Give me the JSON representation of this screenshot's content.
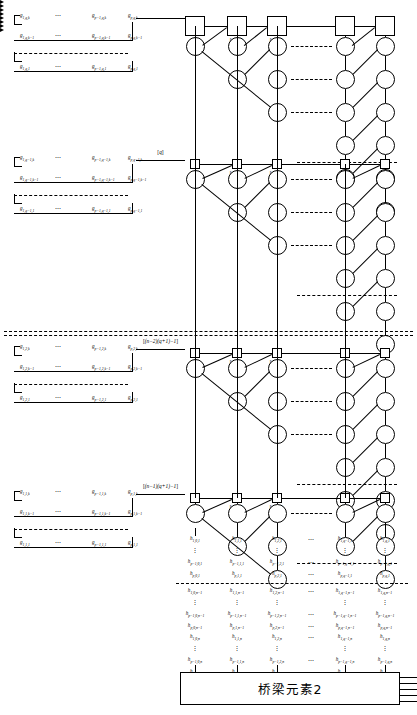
{
  "diagram": {
    "bottom_box": {
      "label": "桥梁元素2"
    },
    "column_tags": [
      "[q]",
      "[q-1]",
      "[q-2]",
      "[1]"
    ],
    "block_tags": [
      "[q]",
      "[(n-2)(q+1)-1]",
      "[(n-1)(q+1)-1]"
    ],
    "ellipsis": "⋯",
    "vertical_ellipsis": "⋮",
    "blocks": [
      {
        "id": "block-1",
        "tag": "",
        "rows": [
          {
            "cells": [
              "g_{1,q,k}",
              "⋯",
              "g_{p-1,q,k}",
              "g_{p,q,k}"
            ]
          },
          {
            "cells": [
              "g_{1,q,k-1}",
              "⋯",
              "g_{p-1,q,k-1}",
              "g_{p,q,k-1}"
            ]
          },
          {
            "cells": [
              "g_{1,q,1}",
              "⋯",
              "g_{p-1,q,1}",
              "g_{p,q,1}"
            ]
          }
        ]
      },
      {
        "id": "block-2",
        "tag": "[q]",
        "rows": [
          {
            "cells": [
              "g_{1,q-1,k}",
              "⋯",
              "g_{p-1,q-1,k}",
              "g_{p,q-1,k}"
            ]
          },
          {
            "cells": [
              "g_{1,q-1,k-1}",
              "⋯",
              "g_{p-1,q-1,k-1}",
              "g_{p,q-1,k-1}"
            ]
          },
          {
            "cells": [
              "g_{1,q-1,1}",
              "⋯",
              "g_{p-1,q-1,1}",
              "g_{p,q-1,1}"
            ]
          }
        ]
      },
      {
        "id": "block-3",
        "tag": "[(n-2)(q+1)-1]",
        "rows": [
          {
            "cells": [
              "g_{1,2,k}",
              "⋯",
              "g_{p-1,2,k}",
              "g_{p,2,k}"
            ]
          },
          {
            "cells": [
              "g_{1,2,k-1}",
              "⋯",
              "g_{p-1,2,k-1}",
              "g_{p,2,k-1}"
            ]
          },
          {
            "cells": [
              "g_{1,2,1}",
              "⋯",
              "g_{p-1,2,1}",
              "g_{p,2,1}"
            ]
          }
        ]
      },
      {
        "id": "block-4",
        "tag": "[(n-1)(q+1)-1]",
        "rows": [
          {
            "cells": [
              "g_{1,1,k}",
              "⋯",
              "g_{p-1,1,k}",
              "g_{p,1,k}"
            ]
          },
          {
            "cells": [
              "g_{1,1,k-1}",
              "⋯",
              "g_{p-1,1,k-1}",
              "g_{p,1,k-1}"
            ]
          },
          {
            "cells": [
              "g_{1,1,1}",
              "⋯",
              "g_{p-1,1,1}",
              "g_{p,1,1}"
            ]
          }
        ]
      }
    ],
    "output_matrix": {
      "columns": [
        "h_{*,0,*}",
        "h_{*,1,*}",
        "h_{*,2,*}",
        "⋯",
        "h_{*,q-1,*}",
        "h_{*,q,*}"
      ],
      "groups": [
        {
          "rows": [
            [
              "h_{1,0,1}",
              "h_{1,1,1}",
              "h_{1,2,1}",
              "⋯",
              "h_{1,q-1,1}",
              "h_{1,q,1}"
            ],
            [
              "⋮",
              "⋮",
              "⋮",
              "",
              "⋮",
              "⋮"
            ],
            [
              "h_{p-1,0,1}",
              "h_{p-1,1,1}",
              "h_{p-1,2,1}",
              "⋯",
              "h_{p-1,q-1,1}",
              "h_{p-1,q,1}"
            ],
            [
              "h_{p,0,1}",
              "h_{p,1,1}",
              "h_{p,2,1}",
              "⋯",
              "h_{p,q-1,1}",
              "h_{p,q,1}"
            ]
          ]
        },
        {
          "rows": [
            [
              "h_{1,0,n-1}",
              "h_{1,1,n-1}",
              "h_{1,2,n-1}",
              "⋯",
              "h_{1,q-1,n-1}",
              "h_{1,q,n-1}"
            ],
            [
              "⋮",
              "⋮",
              "⋮",
              "",
              "⋮",
              "⋮"
            ],
            [
              "h_{p-1,0,n-1}",
              "h_{p-1,1,n-1}",
              "h_{p-1,2,n-1}",
              "⋯",
              "h_{p-1,q-1,n-1}",
              "h_{p-1,q,n-1}"
            ],
            [
              "h_{p,0,n-1}",
              "h_{p,1,n-1}",
              "h_{p,2,n-1}",
              "⋯",
              "h_{p,q-1,n-1}",
              "h_{p,q,n-1}"
            ],
            [
              "h_{1,0,n}",
              "h_{1,1,n}",
              "h_{1,2,n}",
              "⋯",
              "h_{1,q-1,n}",
              "h_{1,q,n}"
            ],
            [
              "⋮",
              "⋮",
              "⋮",
              "",
              "⋮",
              "⋮"
            ],
            [
              "h_{p-1,0,n}",
              "h_{p-1,1,n}",
              "h_{p-1,2,n}",
              "⋯",
              "h_{p-1,q-1,n}",
              "h_{p-1,q,n}"
            ],
            [
              "h_{p,0,n}",
              "h_{p,1,n}",
              "h_{p,2,n}",
              "⋯",
              "h_{p,q-1,n}",
              "h_{p,q,n}"
            ]
          ]
        }
      ],
      "box_inputs": [
        "h_{p,0,n}",
        "h_{p,1,n}",
        "h_{p,2,n}",
        "⋯",
        "h_{p,q-1,n}",
        "h_{p,q,n}"
      ]
    },
    "colors": {
      "stroke": "#000000",
      "background": "#ffffff"
    }
  }
}
